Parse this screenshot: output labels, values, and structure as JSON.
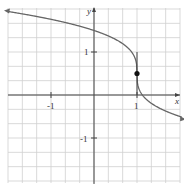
{
  "chart_data": {
    "type": "line",
    "title": "",
    "xlabel": "x",
    "ylabel": "y",
    "xlim": [
      -2.2,
      2.2
    ],
    "ylim": [
      -2.1,
      2.0
    ],
    "grid": true,
    "grid_step": 0.333,
    "x_ticks": [
      {
        "value": -1,
        "label": "-1"
      },
      {
        "value": 1,
        "label": "1"
      }
    ],
    "y_ticks": [
      {
        "value": 1,
        "label": "1"
      },
      {
        "value": -1,
        "label": "-1"
      }
    ],
    "series": [
      {
        "name": "curve",
        "description": "y = 0.5 - cbrt(x - 1), vertical inflection at (1, 0.5), arrows at both ends",
        "x": [
          -2.1,
          -1.5,
          -1.0,
          -0.5,
          0.0,
          0.5,
          0.8,
          0.95,
          1.0,
          1.05,
          1.2,
          1.5,
          2.0,
          2.2
        ],
        "y": [
          1.96,
          1.86,
          1.76,
          1.64,
          1.5,
          1.29,
          1.08,
          0.87,
          0.5,
          0.13,
          -0.08,
          -0.29,
          -0.5,
          -0.56
        ]
      }
    ],
    "points": [
      {
        "x": 1,
        "y": 0.5,
        "filled": true
      }
    ],
    "vertical_line": {
      "x": 1,
      "y_range": [
        0,
        1.0
      ],
      "note": "short vertical tangent segment through the point"
    }
  },
  "labels": {
    "x_axis": "x",
    "y_axis": "y",
    "tick_neg1_x": "-1",
    "tick_pos1_x": "1",
    "tick_pos1_y": "1",
    "tick_neg1_y": "-1"
  }
}
